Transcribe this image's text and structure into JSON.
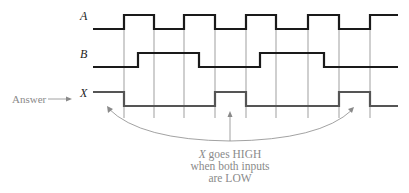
{
  "diagram": {
    "type": "timing-diagram",
    "grid_times": [
      124,
      154,
      184,
      215,
      246,
      276,
      308,
      339,
      370
    ],
    "signals": [
      {
        "name": "A",
        "label_x": 80,
        "y_high": 15,
        "y_low": 29,
        "color": "#1a1a1a",
        "start": 93,
        "end": 398,
        "initial": 0,
        "transitions": [
          124,
          154,
          184,
          215,
          246,
          276,
          308,
          339,
          370
        ]
      },
      {
        "name": "B",
        "label_x": 80,
        "y_high": 53,
        "y_low": 67,
        "color": "#1a1a1a",
        "start": 93,
        "end": 398,
        "initial": 0,
        "transitions": [
          138,
          199,
          260,
          324
        ]
      },
      {
        "name": "X",
        "label_x": 80,
        "y_high": 92,
        "y_low": 106,
        "color": "#555555",
        "start": 93,
        "end": 398,
        "initial": 1,
        "transitions": [
          124,
          215,
          246,
          339,
          370
        ]
      }
    ],
    "answer_label": "Answer",
    "note": {
      "line1_italic": "X",
      "line1_rest": " goes HIGH",
      "line2": "when both inputs",
      "line3": "are LOW"
    },
    "annotation_color": "#8a8a8a"
  }
}
